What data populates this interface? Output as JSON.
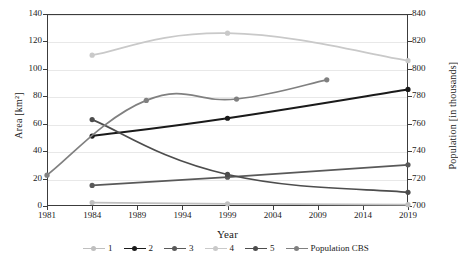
{
  "chart_data": {
    "type": "line",
    "title": "",
    "xlabel": "Year",
    "ylabel": "Area [km²]",
    "y2label": "Population [in thousands]",
    "x_tick_labels": [
      "1981",
      "1984",
      "1989",
      "1994",
      "1999",
      "2004",
      "2009",
      "2014",
      "2019"
    ],
    "y_tick_labels": [
      "0",
      "20",
      "40",
      "60",
      "80",
      "100",
      "120",
      "140"
    ],
    "y2_tick_labels": [
      "700",
      "720",
      "740",
      "760",
      "780",
      "800",
      "820",
      "840"
    ],
    "ylim": [
      0,
      140
    ],
    "y2lim": [
      700,
      840
    ],
    "grid": true,
    "legend_position": "bottom",
    "series": [
      {
        "name": "1",
        "color": "#bfbfbf",
        "axis": "left",
        "points": [
          {
            "x": "1984",
            "y": 2.5
          },
          {
            "x": "1999",
            "y": 1.6
          },
          {
            "x": "2019",
            "y": 1.0
          }
        ]
      },
      {
        "name": "2",
        "color": "#1a1a1a",
        "axis": "left",
        "points": [
          {
            "x": "1984",
            "y": 51
          },
          {
            "x": "1999",
            "y": 64
          },
          {
            "x": "2019",
            "y": 85
          }
        ]
      },
      {
        "name": "3",
        "color": "#595959",
        "axis": "left",
        "points": [
          {
            "x": "1984",
            "y": 15
          },
          {
            "x": "1999",
            "y": 21
          },
          {
            "x": "2019",
            "y": 30
          }
        ]
      },
      {
        "name": "4",
        "color": "#c9c9c9",
        "axis": "right",
        "points": [
          {
            "x": "1984",
            "y": 110
          },
          {
            "x": "1999",
            "y": 126
          },
          {
            "x": "2019",
            "y": 106
          }
        ]
      },
      {
        "name": "5",
        "color": "#4d4d4d",
        "axis": "left",
        "points": [
          {
            "x": "1984",
            "y": 63
          },
          {
            "x": "1999",
            "y": 23
          },
          {
            "x": "2019",
            "y": 10
          }
        ]
      },
      {
        "name": "Population CBS",
        "color": "#808080",
        "axis": "right",
        "points": [
          {
            "x": "1981",
            "y": 22.5
          },
          {
            "x": "1990",
            "y": 77
          },
          {
            "x": "2000",
            "y": 78
          },
          {
            "x": "2010",
            "y": 92
          }
        ]
      }
    ]
  },
  "legend": {
    "items": [
      {
        "label": "1",
        "color": "#bfbfbf"
      },
      {
        "label": "2",
        "color": "#1a1a1a"
      },
      {
        "label": "3",
        "color": "#595959"
      },
      {
        "label": "4",
        "color": "#c9c9c9"
      },
      {
        "label": "5",
        "color": "#4d4d4d"
      },
      {
        "label": "Population CBS",
        "color": "#808080"
      }
    ]
  },
  "colors": {
    "frame": "#3c3c3c",
    "grid": "#e8e8e8",
    "text": "#1a1a1a",
    "background": "#ffffff"
  }
}
